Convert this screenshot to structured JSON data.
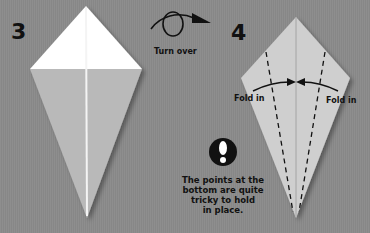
{
  "steps": [
    {
      "number": "3",
      "label": "Step 3 kite shape"
    },
    {
      "number": "4",
      "label": "Step 4 kite shape"
    }
  ],
  "turn_over": {
    "label": "Turn over",
    "icon": "turn-over-arrow-icon"
  },
  "fold_labels": {
    "left": "Fold in",
    "right": "Fold in"
  },
  "tip": {
    "icon": "exclamation-icon",
    "lines": [
      "The points at the",
      "bottom are quite",
      "tricky to hold",
      "in place."
    ]
  },
  "colors": {
    "background": "#8a8a8a",
    "paper_white": "#ffffff",
    "paper_gray": "#b8b8b8",
    "paper_light": "#cfcfcf",
    "ink": "#111111"
  }
}
